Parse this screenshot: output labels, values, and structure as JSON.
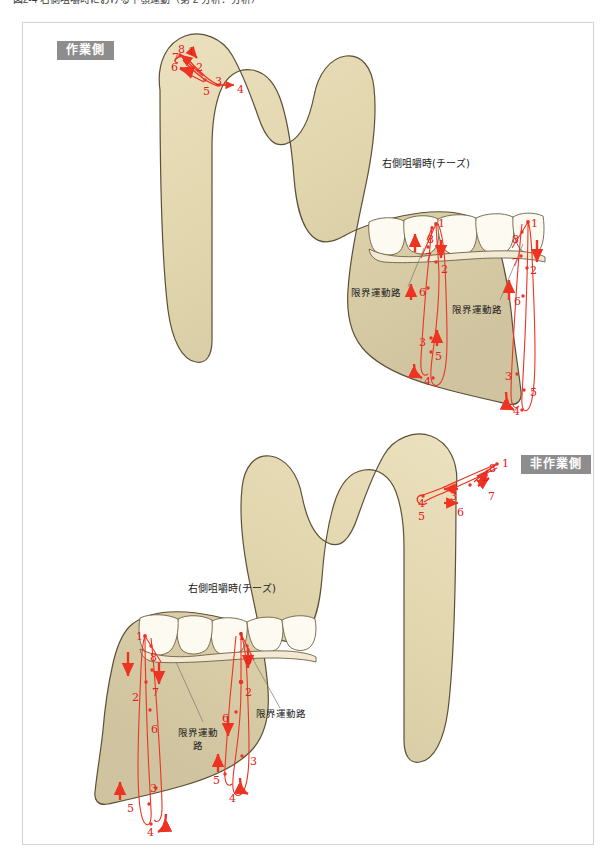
{
  "page": {
    "caption_truncated": "ー 図2-4 右側咀嚼時における下顎運動（第 2 分析：分析）",
    "width": 616,
    "height": 860
  },
  "colors": {
    "bone_light": "#e8dcb8",
    "bone_mid": "#ddd0a8",
    "bone_dark": "#cabf9c",
    "bone_outline": "#5c5037",
    "tooth_fill": "#fdfaf2",
    "tooth_outline": "#6d6045",
    "trace_red": "#ee3322",
    "marker_red": "#e02020",
    "badge_gray": "#8d8d8d",
    "frame_gray": "#d2d2d2",
    "leader_gray": "#7a7a6a"
  },
  "panels": [
    {
      "id": "working-side",
      "badge": "作業側",
      "condyle_title": "右側咀嚼時(チーズ)",
      "border_movement_labels": [
        "限界運動路",
        "限界運動路"
      ],
      "condyle_markers": [
        {
          "label": "8",
          "x": 178,
          "y": 44
        },
        {
          "label": "1",
          "x": 188,
          "y": 46
        },
        {
          "label": "7",
          "x": 172,
          "y": 52
        },
        {
          "label": "6",
          "x": 171,
          "y": 62
        },
        {
          "label": "2",
          "x": 196,
          "y": 62
        },
        {
          "label": "3",
          "x": 215,
          "y": 76
        },
        {
          "label": "5",
          "x": 203,
          "y": 86
        },
        {
          "label": "4",
          "x": 237,
          "y": 84
        }
      ],
      "incisor_markers_inner": [
        {
          "label": "1",
          "x": 438,
          "y": 218
        },
        {
          "label": "8",
          "x": 427,
          "y": 234
        },
        {
          "label": "7",
          "x": 425,
          "y": 252
        },
        {
          "label": "2",
          "x": 441,
          "y": 264
        },
        {
          "label": "6",
          "x": 419,
          "y": 287
        },
        {
          "label": "3",
          "x": 419,
          "y": 337
        },
        {
          "label": "5",
          "x": 435,
          "y": 351
        },
        {
          "label": "4",
          "x": 424,
          "y": 376
        }
      ],
      "incisor_markers_outer": [
        {
          "label": "1",
          "x": 531,
          "y": 218
        },
        {
          "label": "8",
          "x": 512,
          "y": 234
        },
        {
          "label": "7",
          "x": 512,
          "y": 257
        },
        {
          "label": "2",
          "x": 530,
          "y": 265
        },
        {
          "label": "6",
          "x": 514,
          "y": 296
        },
        {
          "label": "3",
          "x": 505,
          "y": 371
        },
        {
          "label": "5",
          "x": 530,
          "y": 387
        },
        {
          "label": "4",
          "x": 513,
          "y": 406
        }
      ]
    },
    {
      "id": "non-working-side",
      "badge": "非作業側",
      "condyle_title": "右側咀嚼時(チーズ)",
      "border_movement_labels": [
        "限界運動路",
        "限界運動路"
      ],
      "condyle_markers": [
        {
          "label": "8",
          "x": 489,
          "y": 463
        },
        {
          "label": "1",
          "x": 502,
          "y": 458
        },
        {
          "label": "2",
          "x": 482,
          "y": 472
        },
        {
          "label": "7",
          "x": 488,
          "y": 491
        },
        {
          "label": "3",
          "x": 450,
          "y": 491
        },
        {
          "label": "6",
          "x": 457,
          "y": 507
        },
        {
          "label": "4",
          "x": 418,
          "y": 498
        },
        {
          "label": "5",
          "x": 418,
          "y": 511
        }
      ],
      "incisor_markers_outer": [
        {
          "label": "1",
          "x": 136,
          "y": 631
        },
        {
          "label": "8",
          "x": 150,
          "y": 652
        },
        {
          "label": "7",
          "x": 152,
          "y": 687
        },
        {
          "label": "2",
          "x": 132,
          "y": 692
        },
        {
          "label": "6",
          "x": 151,
          "y": 724
        },
        {
          "label": "3",
          "x": 150,
          "y": 783
        },
        {
          "label": "5",
          "x": 127,
          "y": 803
        },
        {
          "label": "4",
          "x": 147,
          "y": 827
        }
      ],
      "incisor_markers_inner": [
        {
          "label": "1",
          "x": 238,
          "y": 631
        },
        {
          "label": "8",
          "x": 245,
          "y": 655
        },
        {
          "label": "2",
          "x": 245,
          "y": 687
        },
        {
          "label": "6",
          "x": 222,
          "y": 713
        },
        {
          "label": "3",
          "x": 250,
          "y": 756
        },
        {
          "label": "5",
          "x": 213,
          "y": 775
        },
        {
          "label": "4",
          "x": 229,
          "y": 793
        }
      ]
    }
  ]
}
